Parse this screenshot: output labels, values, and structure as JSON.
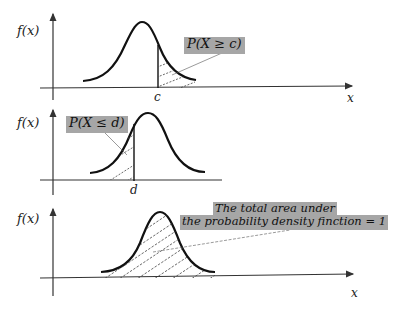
{
  "panels": [
    {
      "id": "upper-tail",
      "y_label": "f(x)",
      "x_label": "x",
      "marker_label": "c",
      "annotation": "P(X ≥ c)",
      "shaded_region": "right of c"
    },
    {
      "id": "lower-tail",
      "y_label": "f(x)",
      "x_label": "",
      "marker_label": "d",
      "annotation": "P(X ≤ d)",
      "shaded_region": "left of d"
    },
    {
      "id": "total-area",
      "y_label": "f(x)",
      "x_label": "x",
      "annotation_line1": "The total area under",
      "annotation_line2": "the probability density finction = 1",
      "shaded_region": "entire curve"
    }
  ],
  "colors": {
    "curve": "#111111",
    "axis": "#333333",
    "label_box": "#a6a6a6",
    "hatch": "#444444"
  }
}
